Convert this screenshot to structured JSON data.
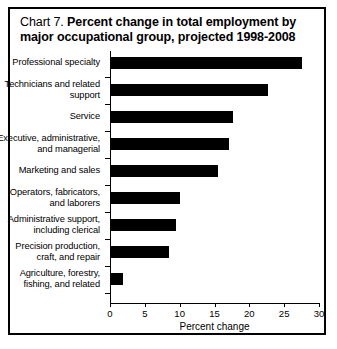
{
  "title": {
    "prefix": "Chart 7.",
    "main": "Percent change in total employment by major occupational group, projected 1998-2008"
  },
  "chart_data": {
    "type": "bar",
    "orientation": "horizontal",
    "title": "Chart 7.  Percent change in total employment by major occupational group, projected 1998-2008",
    "xlabel": "Percent change",
    "ylabel": "",
    "xlim": [
      0,
      30
    ],
    "xticks": [
      0,
      5,
      10,
      15,
      20,
      25,
      30
    ],
    "xtick_labels": [
      "0",
      "5",
      "10",
      "15",
      "20",
      "25",
      "30"
    ],
    "grid": false,
    "legend": false,
    "bar_color": "#000000",
    "categories": [
      "Professional specialty",
      "Technicians and related support",
      "Service",
      "Executive, administrative, and managerial",
      "Marketing and sales",
      "Operators, fabricators, and laborers",
      "Administrative support, including clerical",
      "Precision production, craft, and repair",
      "Agriculture, forestry, fishing, and related"
    ],
    "category_lines": [
      [
        "Professional specialty"
      ],
      [
        "Technicians and related",
        "support"
      ],
      [
        "Service"
      ],
      [
        "Executive, administrative,",
        "and managerial"
      ],
      [
        "Marketing and sales"
      ],
      [
        "Operators, fabricators,",
        "and laborers"
      ],
      [
        "Administrative support,",
        "including clerical"
      ],
      [
        "Precision production,",
        "craft, and repair"
      ],
      [
        "Agriculture, forestry,",
        "fishing, and related"
      ]
    ],
    "values": [
      27.4,
      22.5,
      17.5,
      17.0,
      15.3,
      9.9,
      9.3,
      8.3,
      1.7
    ]
  }
}
